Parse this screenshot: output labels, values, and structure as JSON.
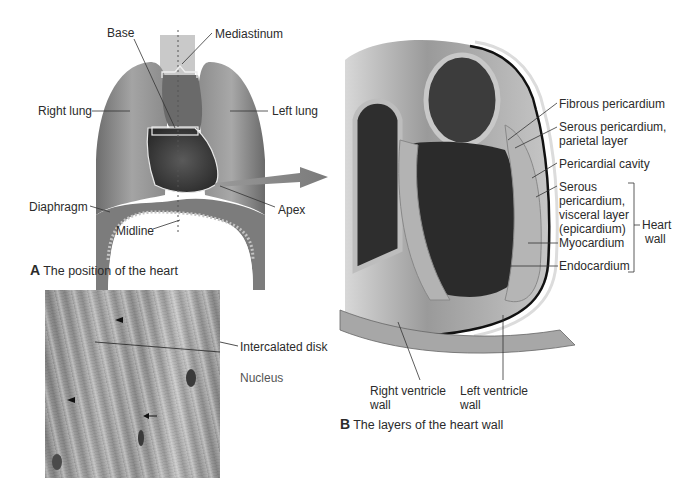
{
  "panel_a": {
    "caption_letter": "A",
    "caption_text": "The position of the heart",
    "labels": {
      "base": "Base",
      "mediastinum": "Mediastinum",
      "right_lung": "Right lung",
      "left_lung": "Left lung",
      "diaphragm": "Diaphragm",
      "midline": "Midline",
      "apex": "Apex"
    }
  },
  "micrograph": {
    "labels": {
      "intercalated_disk": "Intercalated disk",
      "nucleus": "Nucleus"
    }
  },
  "panel_b": {
    "caption_letter": "B",
    "caption_text": "The layers of the heart wall",
    "labels": {
      "fibrous_pericardium": "Fibrous pericardium",
      "serous_parietal_1": "Serous pericardium,",
      "serous_parietal_2": "parietal layer",
      "pericardial_cavity": "Pericardial cavity",
      "serous_visceral_1": "Serous",
      "serous_visceral_2": "pericardium,",
      "serous_visceral_3": "visceral layer",
      "serous_visceral_4": "(epicardium)",
      "myocardium": "Myocardium",
      "endocardium": "Endocardium",
      "heart_wall_1": "Heart",
      "heart_wall_2": "wall",
      "right_ventricle_1": "Right ventricle",
      "right_ventricle_2": "wall",
      "left_ventricle_1": "Left ventricle",
      "left_ventricle_2": "wall"
    }
  }
}
